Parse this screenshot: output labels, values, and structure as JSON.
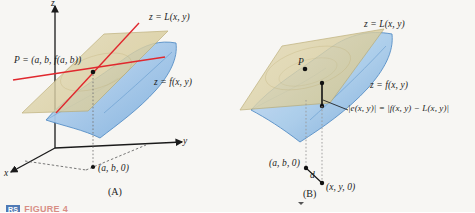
{
  "figure": {
    "caption_badge": "RS",
    "caption_text": "FIGURE 4",
    "background_color": "#f7f6f3",
    "plane_color": "#ddd2a8",
    "surface_color": "#9fc3e6",
    "tangent_line_color": "#e0282e",
    "axis_color": "#1a1a1a"
  },
  "panel_a": {
    "caption": "(A)",
    "axis_x": "x",
    "axis_y": "y",
    "axis_z": "z",
    "plane_label": "z = L(x, y)",
    "surface_label": "z = f(x, y)",
    "point_p_label": "P = (a, b, f(a, b))",
    "base_point_label": "(a, b, 0)"
  },
  "panel_b": {
    "caption": "(B)",
    "plane_label": "z = L(x, y)",
    "surface_label": "z = f(x, y)",
    "point_p_label": "P",
    "error_label": "|e(x, y)| = |f(x, y) − L(x, y)|",
    "base_point_label": "(a, b, 0)",
    "sample_point_label": "(x, y, 0)",
    "distance_label": "d"
  }
}
